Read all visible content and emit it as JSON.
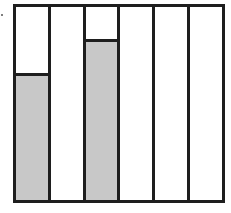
{
  "diagram": {
    "column_count": 6,
    "fill_color": "#c8c8c8",
    "line_color": "#1e1e1e",
    "columns": [
      {
        "index": 1,
        "filled": true,
        "fill_fraction": 0.64
      },
      {
        "index": 2,
        "filled": false,
        "fill_fraction": 0
      },
      {
        "index": 3,
        "filled": true,
        "fill_fraction": 0.82
      },
      {
        "index": 4,
        "filled": false,
        "fill_fraction": 0
      },
      {
        "index": 5,
        "filled": false,
        "fill_fraction": 0
      },
      {
        "index": 6,
        "filled": false,
        "fill_fraction": 0
      }
    ]
  }
}
